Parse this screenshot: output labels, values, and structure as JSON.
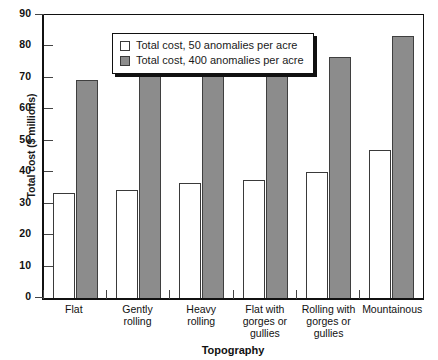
{
  "chart_data": {
    "type": "bar",
    "title": "",
    "xlabel": "Topography",
    "ylabel": "Total cost ($ millions)",
    "ylim": [
      0,
      90
    ],
    "ytick_step": 10,
    "yticks": [
      "0",
      "10",
      "20",
      "30",
      "40",
      "50",
      "60",
      "70",
      "80",
      "90"
    ],
    "grid": false,
    "legend_position": "top-left-inside",
    "categories": [
      "Flat",
      "Gently rolling",
      "Heavy rolling",
      "Flat with gorges or gullies",
      "Rolling with gorges or gullies",
      "Mountainous"
    ],
    "category_lines": [
      [
        "Flat"
      ],
      [
        "Gently",
        "rolling"
      ],
      [
        "Heavy",
        "rolling"
      ],
      [
        "Flat with",
        "gorges or",
        "gullies"
      ],
      [
        "Rolling with",
        "gorges or",
        "gullies"
      ],
      [
        "Mountainous"
      ]
    ],
    "series": [
      {
        "name": "Total cost, 50 anomalies per acre",
        "color": "#ffffff",
        "values": [
          33,
          34,
          36.2,
          37.2,
          39.8,
          46.5
        ]
      },
      {
        "name": "Total cost, 400 anomalies per acre",
        "color": "#8c8c8c",
        "values": [
          68.5,
          69.8,
          72,
          73,
          75.8,
          82.5
        ]
      }
    ]
  },
  "legend": {
    "entries": [
      {
        "label": "Total cost, 50 anomalies per acre"
      },
      {
        "label": "Total cost, 400 anomalies per acre"
      }
    ]
  }
}
